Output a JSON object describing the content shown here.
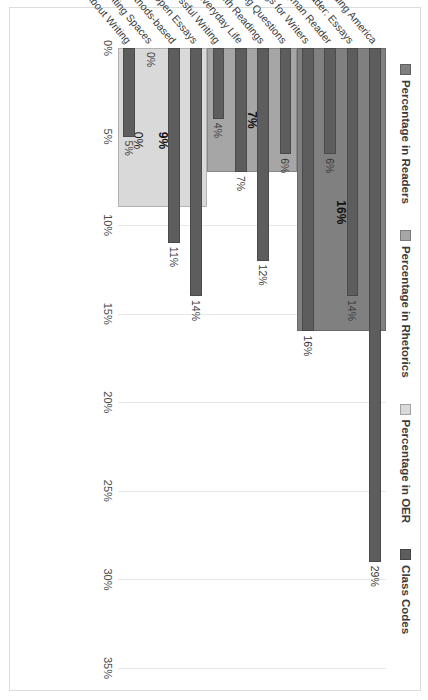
{
  "chart_data": {
    "type": "bar",
    "orientation": "vertical-rotated",
    "title": "",
    "xlabel": "",
    "ylabel": "",
    "ylim": [
      0,
      35
    ],
    "ytick_labels": [
      "0%",
      "5%",
      "10%",
      "15%",
      "20%",
      "25%",
      "30%",
      "35%"
    ],
    "ytick_values": [
      0,
      5,
      10,
      15,
      20,
      25,
      30,
      35
    ],
    "grid": true,
    "legend_position": "top",
    "categories": [
      "Rereading America",
      "Seagull Reader: Essays",
      "Longman Reader",
      "Readings for Writers",
      "Current Issues and Enduring Questions",
      "Composition with Readings",
      "Composition of Everyday Life",
      "Strategies for Successful Writing",
      "88 Open Essays",
      "English Composition 1: Rhetorical Methods-based",
      "Writing Spaces",
      "Bad Ideas About Writing"
    ],
    "series": [
      {
        "name": "Percentage in Readers",
        "color": "#808080",
        "kind": "band",
        "value": 16,
        "label": "16%",
        "from_category": "Rereading America",
        "to_category": "Readings for Writers"
      },
      {
        "name": "Percentage in Rhetorics",
        "color": "#a6a6a6",
        "kind": "band",
        "value": 7,
        "label": "7%",
        "from_category": "Current Issues and Enduring Questions",
        "to_category": "Strategies for Successful Writing"
      },
      {
        "name": "Percentage in OER",
        "color": "#d9d9d9",
        "kind": "band",
        "value": 9,
        "label": "9%",
        "second_label": "0%",
        "from_category": "88 Open Essays",
        "to_category": "Bad Ideas About Writing"
      },
      {
        "name": "Class Codes",
        "color": "#5d5d5d",
        "kind": "bars",
        "values": [
          29,
          14,
          6,
          16,
          6,
          12,
          7,
          4,
          14,
          11,
          0,
          5
        ],
        "labels": [
          "29%",
          "14%",
          "6%",
          "16%",
          "6%",
          "12%",
          "7%",
          "4%",
          "14%",
          "11%",
          "0%",
          "5%"
        ]
      }
    ]
  },
  "legend": {
    "items": [
      {
        "label": "Percentage in Readers",
        "color": "#808080"
      },
      {
        "label": "Percentage in Rhetorics",
        "color": "#a6a6a6"
      },
      {
        "label": "Percentage in OER",
        "color": "#d9d9d9"
      },
      {
        "label": "Class Codes",
        "color": "#5d5d5d"
      }
    ]
  }
}
